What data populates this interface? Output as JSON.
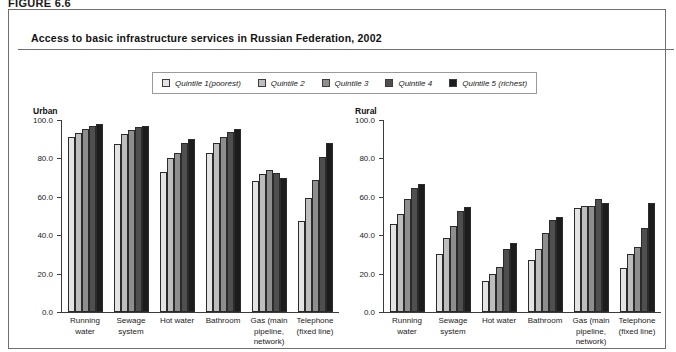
{
  "figure": {
    "label": "FIGURE 6.6",
    "title": "Access to basic infrastructure services in Russian Federation, 2002"
  },
  "legend": {
    "items": [
      {
        "label": "Quintile 1(poorest)",
        "color": "#e4e4e4"
      },
      {
        "label": "Quintile 2",
        "color": "#bdbdbd"
      },
      {
        "label": "Quintile 3",
        "color": "#8e8e8e"
      },
      {
        "label": "Quintile 4",
        "color": "#4f4f4f"
      },
      {
        "label": "Quintile 5 (richest)",
        "color": "#1c1c1c"
      }
    ]
  },
  "chart_data": [
    {
      "type": "bar",
      "title": "Urban",
      "xlabel": "",
      "ylabel": "",
      "ylim": [
        0,
        100
      ],
      "yticks": [
        "0.0",
        "20.0",
        "40.0",
        "60.0",
        "80.0",
        "100.0"
      ],
      "grid": false,
      "legend_position": "top",
      "categories": [
        "Running water",
        "Sewage system",
        "Hot water",
        "Bathroom",
        "Gas (main pipeline, network)",
        "Telephone (fixed line)"
      ],
      "series": [
        {
          "name": "Quintile 1(poorest)",
          "values": [
            91.0,
            87.5,
            73.0,
            83.0,
            68.0,
            47.5
          ]
        },
        {
          "name": "Quintile 2",
          "values": [
            93.0,
            92.5,
            80.0,
            88.0,
            72.0,
            59.5
          ]
        },
        {
          "name": "Quintile 3",
          "values": [
            95.5,
            95.0,
            83.0,
            91.0,
            74.0,
            68.5
          ]
        },
        {
          "name": "Quintile 4",
          "values": [
            97.0,
            96.5,
            88.0,
            94.0,
            72.5,
            80.5
          ]
        },
        {
          "name": "Quintile 5 (richest)",
          "values": [
            98.0,
            97.0,
            90.0,
            95.5,
            70.0,
            88.0
          ]
        }
      ]
    },
    {
      "type": "bar",
      "title": "Rural",
      "xlabel": "",
      "ylabel": "",
      "ylim": [
        0,
        100
      ],
      "yticks": [
        "0.0",
        "20.0",
        "40.0",
        "60.0",
        "80.0",
        "100.0"
      ],
      "grid": false,
      "legend_position": "top",
      "categories": [
        "Running water",
        "Sewage system",
        "Hot water",
        "Bathroom",
        "Gas (main pipeline, network)",
        "Telephone (fixed line)"
      ],
      "series": [
        {
          "name": "Quintile 1(poorest)",
          "values": [
            46.0,
            30.0,
            16.0,
            27.0,
            54.0,
            23.0
          ]
        },
        {
          "name": "Quintile 2",
          "values": [
            51.0,
            38.5,
            20.0,
            33.0,
            55.0,
            30.0
          ]
        },
        {
          "name": "Quintile 3",
          "values": [
            59.0,
            45.0,
            23.5,
            41.0,
            55.0,
            34.0
          ]
        },
        {
          "name": "Quintile 4",
          "values": [
            64.5,
            52.5,
            33.0,
            48.0,
            59.0,
            44.0
          ]
        },
        {
          "name": "Quintile 5 (richest)",
          "values": [
            66.5,
            54.5,
            36.0,
            49.5,
            57.0,
            57.0
          ]
        }
      ]
    }
  ]
}
